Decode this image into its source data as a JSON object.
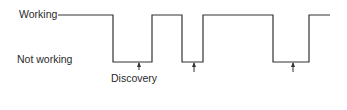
{
  "diagram": {
    "labels": {
      "working": "Working",
      "not_working": "Not working",
      "discovery": "Discovery"
    },
    "states": [
      "working",
      "not_working",
      "working",
      "not_working",
      "working",
      "not_working",
      "working"
    ],
    "discovery_markers": 3,
    "line_color": "#333333"
  }
}
